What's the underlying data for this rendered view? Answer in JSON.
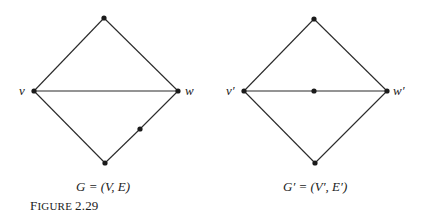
{
  "figure": {
    "label_first": "F",
    "label_rest": "IGURE",
    "number": "2.29"
  },
  "graphs": [
    {
      "caption": "G = (V, E)",
      "nodes": {
        "top": [
          104,
          18
        ],
        "v": [
          34,
          91
        ],
        "w": [
          178,
          91
        ],
        "bottom": [
          105,
          163
        ],
        "extra": [
          140,
          129
        ]
      },
      "node_labels": {
        "v": "v",
        "w": "w"
      },
      "edges": [
        [
          "v",
          "top"
        ],
        [
          "top",
          "w"
        ],
        [
          "v",
          "w"
        ],
        [
          "v",
          "bottom"
        ],
        [
          "bottom",
          "extra"
        ],
        [
          "extra",
          "w"
        ]
      ]
    },
    {
      "caption": "G′ = (V′, E′)",
      "nodes": {
        "top": [
          314,
          19
        ],
        "v": [
          244,
          91
        ],
        "w": [
          387,
          91
        ],
        "bottom": [
          315,
          163
        ],
        "mid": [
          314,
          91
        ]
      },
      "node_labels": {
        "v": "v′",
        "w": "w′"
      },
      "edges": [
        [
          "v",
          "top"
        ],
        [
          "top",
          "w"
        ],
        [
          "v",
          "mid"
        ],
        [
          "mid",
          "w"
        ],
        [
          "v",
          "bottom"
        ],
        [
          "bottom",
          "w"
        ]
      ]
    }
  ],
  "colors": {
    "stroke": "#2a2a2a",
    "node": "#1a1a1a"
  }
}
